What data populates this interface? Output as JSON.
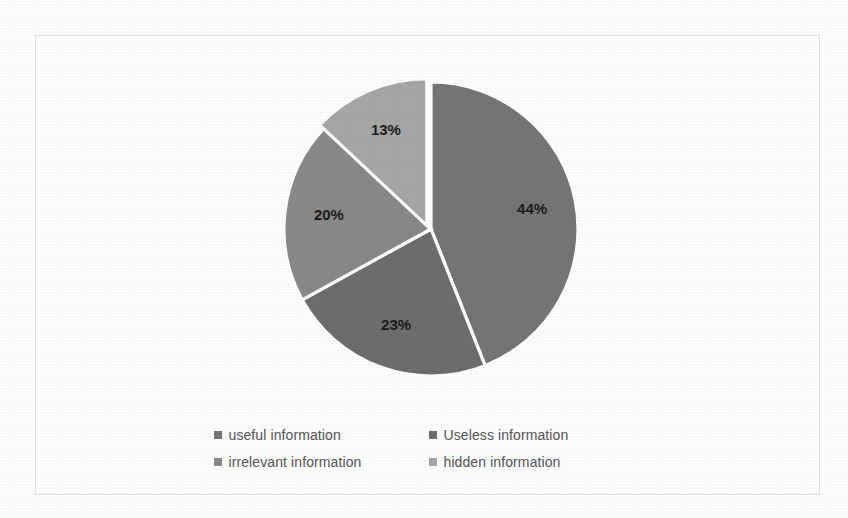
{
  "chart_data": {
    "type": "pie",
    "title": "",
    "labels": [
      "useful information",
      "Useless information",
      "irrelevant information",
      "hidden information"
    ],
    "values": [
      44,
      23,
      20,
      13
    ],
    "value_labels": [
      "44%",
      "23%",
      "20%",
      "13%"
    ],
    "colors": [
      "#767676",
      "#6e6e6e",
      "#8a8a8a",
      "#a8a8a8"
    ],
    "legend_position": "bottom",
    "legend_columns": 2,
    "grid": false,
    "start_angle_deg": 0,
    "direction": "clockwise",
    "exploded_slices": [
      "hidden information"
    ],
    "slice_separator_color": "#ffffff",
    "label_color": "#1d1d1d",
    "legend_text_color": "#555555",
    "background_color": "#ffffff",
    "frame_border_color": "#e2e2e2"
  },
  "legend": {
    "rows": [
      {
        "a": {
          "label": "useful information",
          "color": "#767676"
        },
        "b": {
          "label": "Useless information",
          "color": "#6e6e6e"
        }
      },
      {
        "a": {
          "label": "irrelevant information",
          "color": "#8a8a8a"
        },
        "b": {
          "label": "hidden information",
          "color": "#a8a8a8"
        }
      }
    ]
  },
  "slice_labels": {
    "s1": "44%",
    "s2": "23%",
    "s3": "20%",
    "s4": "13%"
  }
}
